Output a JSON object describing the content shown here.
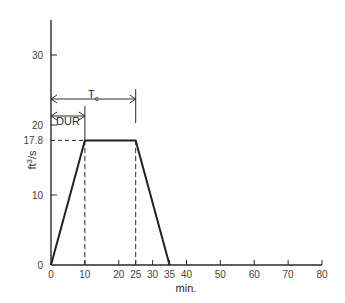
{
  "chart_data": {
    "type": "line",
    "title": "",
    "xlabel": "min.",
    "ylabel": "ft3/s",
    "ylabel_display": "ft³/s",
    "xlim": [
      0,
      80
    ],
    "ylim": [
      0,
      35
    ],
    "grid": false,
    "x_ticks": [
      0,
      10,
      20,
      25,
      30,
      35,
      40,
      50,
      60,
      70,
      80
    ],
    "y_ticks": [
      0,
      10,
      17.8,
      20,
      30
    ],
    "y_tick_labels": [
      "0",
      "10",
      "17.8",
      "20",
      "30"
    ],
    "series": [
      {
        "name": "hydrograph",
        "x": [
          0,
          10,
          25,
          35
        ],
        "y": [
          0,
          17.8,
          17.8,
          0
        ]
      }
    ],
    "annotations": [
      {
        "type": "dashed-hline",
        "label": "17.8",
        "y": 17.8,
        "x_from": 0,
        "x_to": 10
      },
      {
        "type": "dashed-vline",
        "x": 10,
        "y_from": 0,
        "y_to": 17.8
      },
      {
        "type": "dashed-vline",
        "x": 25,
        "y_from": 0,
        "y_to": 17.8
      },
      {
        "type": "dimension-arrow",
        "label": "DUR",
        "x_from": 0,
        "x_to": 10
      },
      {
        "type": "dimension-arrow",
        "label": "T",
        "subscript": "c",
        "x_from": 0,
        "x_to": 25
      }
    ]
  },
  "labels": {
    "xlabel": "min.",
    "ylabel_base": "ft",
    "ylabel_sup": "3",
    "ylabel_tail": "/s",
    "dur": "DUR",
    "tc_main": "T",
    "tc_sub": "c",
    "peak": "17.8"
  }
}
